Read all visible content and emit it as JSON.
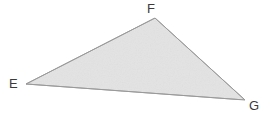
{
  "figure": {
    "type": "triangle",
    "name": "Triangle EFG",
    "canvas": {
      "width": 271,
      "height": 121,
      "background": "#ffffff"
    },
    "style": {
      "fill": "#e3e3e3",
      "stroke": "#a0a0a0",
      "stroke_width": 1,
      "label_color": "#3b3b3b",
      "label_font_size": 13
    },
    "vertices": [
      {
        "label": "E",
        "x": 26,
        "y": 84,
        "label_x": 9,
        "label_y": 77
      },
      {
        "label": "F",
        "x": 155,
        "y": 18,
        "label_x": 147,
        "label_y": 2
      },
      {
        "label": "G",
        "x": 245,
        "y": 100,
        "label_x": 249,
        "label_y": 99
      }
    ],
    "edges": [
      {
        "name": "EF",
        "from": "E",
        "to": "F"
      },
      {
        "name": "FG",
        "from": "F",
        "to": "G"
      },
      {
        "name": "GE",
        "from": "G",
        "to": "E"
      }
    ],
    "polygon_points": "26,84 155,18 245,100"
  }
}
